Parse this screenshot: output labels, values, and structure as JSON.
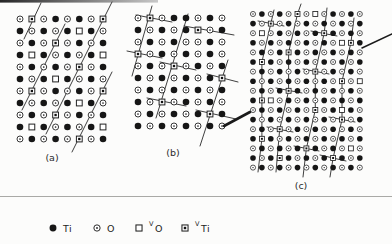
{
  "figure": {
    "top_bar": {
      "x": 0,
      "y": 0,
      "width": 158,
      "height": 2.6,
      "color_start": "#262626",
      "color_end": "#c8c8c8"
    },
    "separator_rule": {
      "y": 196.5,
      "x1": 0,
      "x2": 392,
      "color": "#a9a9a6",
      "width": 1
    },
    "line_color": "#3f3f3f",
    "ink_color": "#1a1a1a",
    "pointer_lines": [
      {
        "name": "bc-arrow",
        "points": [
          [
            224,
            126
          ],
          [
            250,
            112
          ]
        ],
        "width": 2.6
      },
      {
        "name": "c-leader",
        "points": [
          [
            362,
            48
          ],
          [
            392,
            34
          ]
        ],
        "width": 1.5
      }
    ],
    "panels": [
      {
        "id": "a",
        "label": "(a)",
        "label_pos": [
          52,
          161
        ],
        "origin": [
          20,
          19
        ],
        "dx": 11.86,
        "dy": 12,
        "scale": 1,
        "rows": [
          "o v o t o t o v",
          "t o t o t s t o",
          "o t o v o t o t",
          "t s t o t o t s",
          "o t o t o v o t",
          "t o t s t o t o",
          "o v o t o t o v",
          "t o t o t s t o",
          "o t o v o t o t",
          "t s t o t o t s",
          "o t o t o v o t"
        ],
        "lines": [
          [
            [
              41,
              3
            ],
            [
              24,
              39
            ]
          ],
          [
            [
              65,
              24
            ],
            [
              22,
              110
            ]
          ],
          [
            [
              112,
              2
            ],
            [
              46,
              134
            ]
          ],
          [
            [
              112,
              72
            ],
            [
              72,
              152
            ]
          ]
        ]
      },
      {
        "id": "b",
        "label": "(b)",
        "label_pos": [
          173,
          156
        ],
        "origin": [
          138,
          18
        ],
        "dx": 12,
        "dy": 12,
        "scale": 1,
        "rows": [
          "o v o t t o t o",
          "t o t o t v o t",
          "o t o t o o t o",
          "v o t o t o t o",
          "o t o v o t o t",
          "t o t o t o t v",
          "o t o t o t o t",
          "t o v o t o t o",
          "o t o t o t v t",
          "t o t o t o t o"
        ],
        "lines": [
          [
            [
              152,
              6
            ],
            [
              132,
              76
            ]
          ],
          [
            [
              188,
              14
            ],
            [
              156,
              118
            ]
          ],
          [
            [
              228,
              60
            ],
            [
              200,
              146
            ]
          ],
          [
            [
              136,
              15
            ],
            [
              172,
              22
            ]
          ],
          [
            [
              184,
              26
            ],
            [
              234,
              35
            ]
          ],
          [
            [
              127,
              51
            ],
            [
              162,
              58
            ]
          ],
          [
            [
              160,
              62
            ],
            [
              196,
              70
            ]
          ],
          [
            [
              207,
              74
            ],
            [
              238,
              82
            ]
          ],
          [
            [
              147,
              98
            ],
            [
              186,
              106
            ]
          ],
          [
            [
              196,
              110
            ],
            [
              236,
              119
            ]
          ]
        ]
      },
      {
        "id": "c",
        "label": "(c)",
        "label_pos": [
          301,
          189
        ],
        "origin": [
          253,
          14
        ],
        "dx": 8.9,
        "dy": 9.6,
        "scale": 0.85,
        "rows": [
          "o t o t o v o s o t o t o",
          "t o v o t o t o t o t o t",
          "o s o t o t o t v t o t o",
          "t o t o t o t o t o s v t",
          "o t o t v t o t o t o t o",
          "t v t o t o t o t o t o t",
          "o t o t o t o v o t o t o",
          "t o t o t o t o t o v o s",
          "o t o t v t o t o t o t o",
          "t v s o t o t o t o t o t",
          "o t o t o t o v o t s t o",
          "t o t o t o t o t o v o t",
          "o t o v o t o t o t o t o",
          "t v t o t o t o t o t o t",
          "o t o t o t v t o t o s o",
          "t o t v t o t o t v t o t",
          "o t o t o t o t o t o t o"
        ],
        "lines": [
          [
            [
              274,
              10
            ],
            [
              270.8,
              23.6
            ],
            [
              261.9,
              62
            ],
            [
              261.9,
              100.4
            ],
            [
              261.9,
              138.8
            ],
            [
              258,
              172
            ]
          ],
          [
            [
              301,
              4
            ],
            [
              297.5,
              14
            ],
            [
              288.6,
              52.4
            ],
            [
              288.6,
              90.8
            ],
            [
              279.7,
              129.2
            ],
            [
              276,
              172
            ]
          ],
          [
            [
              327,
              8
            ],
            [
              324.2,
              33.2
            ],
            [
              315.3,
              71.6
            ],
            [
              315.3,
              110
            ],
            [
              306.4,
              148.4
            ],
            [
              303,
              177
            ]
          ],
          [
            [
              354,
              18
            ],
            [
              350.9,
              42.8
            ],
            [
              342,
              81.2
            ],
            [
              342,
              119.6
            ],
            [
              333.1,
              158
            ],
            [
              330,
              177
            ]
          ],
          [
            [
              258,
              21
            ],
            [
              284,
              26
            ]
          ],
          [
            [
              311,
              31
            ],
            [
              337,
              36
            ]
          ],
          [
            [
              303,
              69
            ],
            [
              329,
              74
            ]
          ],
          [
            [
              276,
              88
            ],
            [
              302,
              93
            ]
          ],
          [
            [
              329,
              117
            ],
            [
              355,
              122
            ]
          ],
          [
            [
              267,
              127
            ],
            [
              293,
              132
            ]
          ],
          [
            [
              294,
              146
            ],
            [
              319,
              151
            ]
          ],
          [
            [
              320,
              155
            ],
            [
              346,
              161
            ]
          ]
        ]
      }
    ]
  },
  "legend": {
    "items": [
      {
        "symbol": "t",
        "sup": "",
        "label": "Ti",
        "x": 47
      },
      {
        "symbol": "o",
        "sup": "",
        "label": "O",
        "x": 91
      },
      {
        "symbol": "s",
        "sup": "V",
        "label": "O",
        "x": 133
      },
      {
        "symbol": "v",
        "sup": "V",
        "label": "Ti",
        "x": 179
      }
    ]
  }
}
